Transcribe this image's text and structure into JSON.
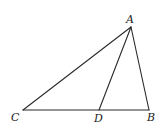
{
  "diagram": {
    "type": "geometry-triangle",
    "points": {
      "A": {
        "label": "A",
        "x": 131,
        "y": 27,
        "label_x": 126,
        "label_y": 23
      },
      "B": {
        "label": "B",
        "x": 149,
        "y": 110,
        "label_x": 147,
        "label_y": 121
      },
      "C": {
        "label": "C",
        "x": 23,
        "y": 110,
        "label_x": 11,
        "label_y": 121
      },
      "D": {
        "label": "D",
        "x": 99,
        "y": 110,
        "label_x": 94,
        "label_y": 122
      }
    },
    "segments": [
      {
        "name": "segment-AC",
        "from": "A",
        "to": "C"
      },
      {
        "name": "segment-AB",
        "from": "A",
        "to": "B"
      },
      {
        "name": "segment-AD",
        "from": "A",
        "to": "D"
      },
      {
        "name": "segment-CB",
        "from": "C",
        "to": "B"
      }
    ],
    "line_color": "#2a2a2a",
    "background": "#ffffff"
  }
}
